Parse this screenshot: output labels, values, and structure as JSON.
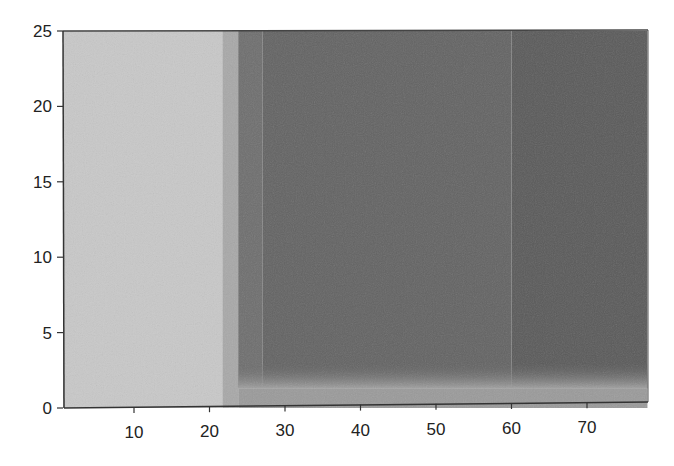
{
  "chart_data": {
    "type": "heatmap",
    "title": "",
    "xlabel": "",
    "ylabel": "",
    "xlim": [
      0.6,
      78
    ],
    "ylim": [
      0,
      25
    ],
    "grid": false,
    "legend": null,
    "x_ticks": [
      10,
      20,
      30,
      40,
      50,
      60,
      70
    ],
    "y_ticks": [
      0,
      5,
      10,
      15,
      20,
      25
    ],
    "colormap": "grayscale",
    "regions": [
      {
        "name": "light-region",
        "x_range": [
          0.6,
          21.7
        ],
        "y_range": [
          0,
          25
        ],
        "shade": "#c8c8c8"
      },
      {
        "name": "transition-band",
        "x_range": [
          21.7,
          23.8
        ],
        "y_range": [
          0,
          25
        ],
        "shade": "#a8a8a8"
      },
      {
        "name": "dark-region-a",
        "x_range": [
          23.8,
          27
        ],
        "y_range": [
          1.3,
          25
        ],
        "shade": "#6e6e6e"
      },
      {
        "name": "dark-region-b",
        "x_range": [
          27,
          60
        ],
        "y_range": [
          1.3,
          25
        ],
        "shade": "#636363"
      },
      {
        "name": "dark-region-c",
        "x_range": [
          60,
          78
        ],
        "y_range": [
          1.3,
          25
        ],
        "shade": "#5a5a5a"
      },
      {
        "name": "bottom-strip",
        "x_range": [
          23.8,
          78
        ],
        "y_range": [
          0,
          1.3
        ],
        "shade": "#9a9a9a"
      }
    ]
  },
  "axes": {
    "x_tick_labels": [
      "10",
      "20",
      "30",
      "40",
      "50",
      "60",
      "70"
    ],
    "y_tick_labels": [
      "0",
      "5",
      "10",
      "15",
      "20",
      "25"
    ]
  }
}
